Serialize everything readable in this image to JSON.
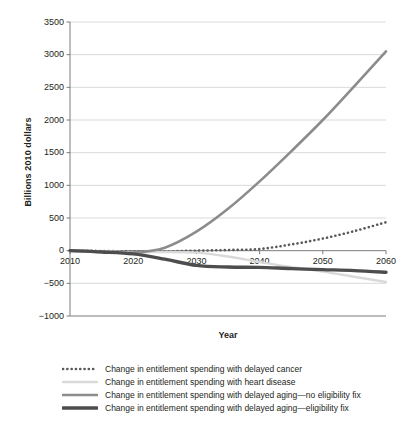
{
  "chart_data": {
    "type": "line",
    "title": "",
    "xlabel": "Year",
    "ylabel": "Billions 2010 dollars",
    "xlim": [
      2010,
      2060
    ],
    "ylim": [
      -1000,
      3500
    ],
    "grid": true,
    "legend_position": "bottom",
    "xticks": [
      "2010",
      "2020",
      "2030",
      "2040",
      "2050",
      "2060"
    ],
    "yticks": [
      "3500",
      "3000",
      "2500",
      "2000",
      "1500",
      "1000",
      "500",
      "0",
      "-500",
      "-1000"
    ],
    "x": [
      2010,
      2015,
      2020,
      2025,
      2030,
      2035,
      2040,
      2045,
      2050,
      2055,
      2060
    ],
    "series": [
      {
        "name": "Change in entitlement spending with delayed cancer",
        "style": "dotted",
        "color": "#58595b",
        "values": [
          0,
          -5,
          -12,
          -10,
          0,
          10,
          25,
          95,
          185,
          300,
          435
        ]
      },
      {
        "name": "Change in entitlement spending with heart disease",
        "style": "solid-thin",
        "color": "#d9d9d9",
        "values": [
          0,
          -10,
          -25,
          -20,
          -30,
          -90,
          -175,
          -250,
          -320,
          -400,
          -480
        ]
      },
      {
        "name": "Change in entitlement spending with delayed aging—no eligibility fix",
        "style": "solid-medium",
        "color": "#8c8c8c",
        "values": [
          0,
          -15,
          -30,
          45,
          290,
          640,
          1060,
          1520,
          2000,
          2520,
          3050
        ]
      },
      {
        "name": "Change in entitlement spending with delayed aging—eligibility fix",
        "style": "solid-thick",
        "color": "#4d4d4d",
        "values": [
          0,
          -20,
          -50,
          -130,
          -225,
          -250,
          -255,
          -275,
          -290,
          -305,
          -330
        ]
      }
    ]
  },
  "axes": {
    "ylabel": "Billions 2010 dollars",
    "xlabel": "Year",
    "yticks": [
      "3500",
      "3000",
      "2500",
      "2000",
      "1500",
      "1000",
      "500",
      "0",
      "-500",
      "-1000"
    ],
    "xticks": [
      "2010",
      "2020",
      "2030",
      "2040",
      "2050",
      "2060"
    ]
  },
  "legend": {
    "items": [
      {
        "label": "Change in entitlement spending with delayed cancer"
      },
      {
        "label": "Change in entitlement spending with heart disease"
      },
      {
        "label": "Change in entitlement spending with delayed aging—no eligibility fix"
      },
      {
        "label": "Change in entitlement spending with delayed aging—eligibility fix"
      }
    ]
  }
}
